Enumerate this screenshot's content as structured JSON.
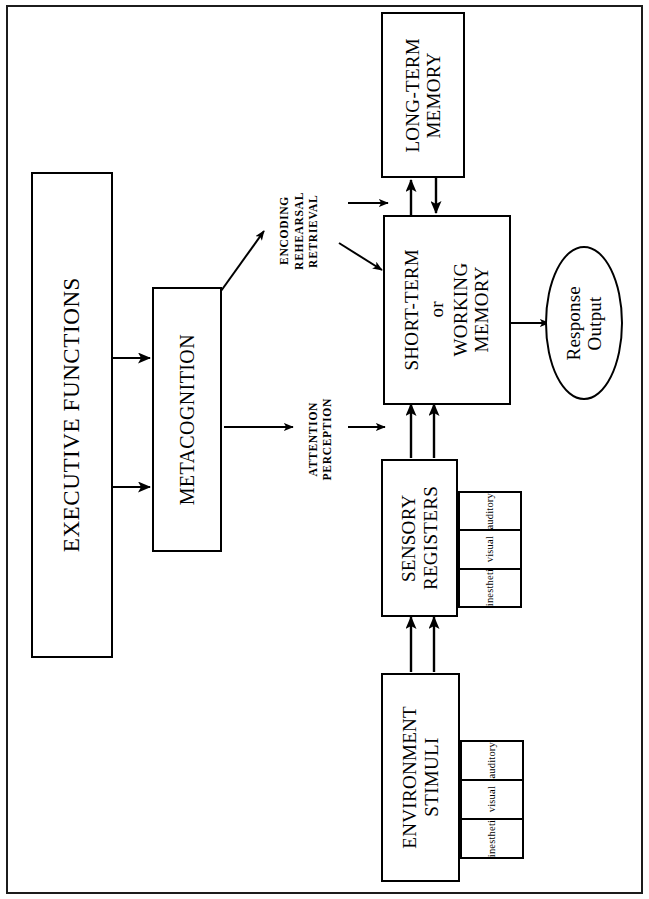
{
  "diagram": {
    "orientation": "rotated-90-ccw",
    "colors": {
      "stroke": "#000000",
      "background": "#ffffff",
      "frame": "#1c1c1c"
    },
    "nodes": {
      "executive_functions": {
        "label": "EXECUTIVE FUNCTIONS",
        "shape": "rectangle"
      },
      "metacognition": {
        "label": "METACOGNITION",
        "shape": "rectangle"
      },
      "long_term_memory": {
        "line1": "LONG-TERM",
        "line2": "MEMORY",
        "shape": "rectangle"
      },
      "short_term_memory": {
        "line1": "SHORT-TERM",
        "line2": "or",
        "line3": "WORKING",
        "line4": "MEMORY",
        "shape": "rectangle"
      },
      "sensory_registers": {
        "line1": "SENSORY",
        "line2": "REGISTERS",
        "shape": "rectangle"
      },
      "environment_stimuli": {
        "line1": "ENVIRONMENT",
        "line2": "STIMULI",
        "shape": "rectangle"
      },
      "response_output": {
        "line1": "Response",
        "line2": "Output",
        "shape": "ellipse"
      }
    },
    "modality_lists": {
      "sensory_registers": [
        "auditory",
        "visual",
        "kinesthetic"
      ],
      "environment_stimuli": [
        "auditory",
        "visual",
        "kinesthetic"
      ]
    },
    "edge_labels": {
      "encoding_rehearsal_retrieval": {
        "line1": "ENCODING",
        "line2": "REHEARSAL",
        "line3": "RETRIEVAL"
      },
      "attention_perception": {
        "line1": "ATTENTION",
        "line2": "PERCEPTION"
      }
    },
    "connections": [
      {
        "from": "executive_functions",
        "to": "metacognition",
        "type": "arrow",
        "count": 2
      },
      {
        "from": "metacognition",
        "to": "encoding_rehearsal_retrieval",
        "type": "diagonal-arrow"
      },
      {
        "from": "metacognition",
        "to": "attention_perception",
        "type": "arrow"
      },
      {
        "from": "encoding_rehearsal_retrieval",
        "to": "long_term_memory",
        "type": "arrow"
      },
      {
        "from": "encoding_rehearsal_retrieval",
        "to": "short_term_memory",
        "type": "diagonal-arrow"
      },
      {
        "from": "attention_perception",
        "to": "short_term_memory",
        "type": "arrow"
      },
      {
        "from": "short_term_memory",
        "to": "long_term_memory",
        "type": "arrow"
      },
      {
        "from": "long_term_memory",
        "to": "short_term_memory",
        "type": "arrow"
      },
      {
        "from": "sensory_registers",
        "to": "short_term_memory",
        "type": "arrow",
        "count": 2
      },
      {
        "from": "environment_stimuli",
        "to": "sensory_registers",
        "type": "arrow",
        "count": 2
      },
      {
        "from": "short_term_memory",
        "to": "response_output",
        "type": "arrow"
      }
    ]
  }
}
